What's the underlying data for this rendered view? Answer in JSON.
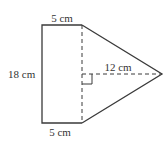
{
  "figure": {
    "labels": {
      "top_width": "5 cm",
      "bottom_width": "5 cm",
      "height": "18 cm",
      "triangle_height": "12 cm"
    },
    "colors": {
      "stroke": "#3a3a3a",
      "text": "#333333",
      "background": "#ffffff"
    }
  }
}
